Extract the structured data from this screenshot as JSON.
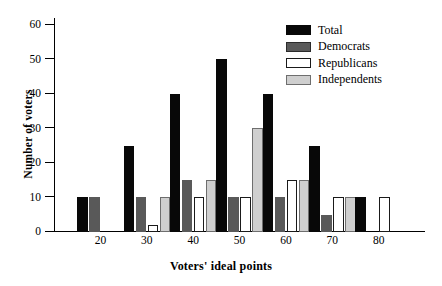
{
  "chart_data": {
    "type": "bar",
    "title": "",
    "xlabel": "Voters' ideal points",
    "ylabel": "Number of voters",
    "categories": [
      "20",
      "30",
      "40",
      "50",
      "60",
      "70",
      "80"
    ],
    "series": [
      {
        "name": "Total",
        "color": "#080808",
        "values": [
          10,
          25,
          40,
          50,
          40,
          25,
          10
        ]
      },
      {
        "name": "Democrats",
        "color": "#595959",
        "values": [
          10,
          10,
          15,
          10,
          10,
          5,
          0
        ]
      },
      {
        "name": "Republicans",
        "color": "#ffffff",
        "values": [
          0,
          2,
          10,
          10,
          15,
          10,
          10
        ]
      },
      {
        "name": "Independents",
        "color": "#cfcfcf",
        "values": [
          0,
          10,
          15,
          30,
          15,
          10,
          0
        ]
      }
    ],
    "ylim": [
      0,
      62
    ],
    "yticks": [
      0,
      10,
      20,
      30,
      40,
      50,
      60
    ],
    "xticks": [
      20,
      30,
      40,
      50,
      60,
      70,
      80
    ],
    "grid": false,
    "legend_position": "top-right"
  },
  "legend": {
    "entries": [
      {
        "label": "Total"
      },
      {
        "label": "Democrats"
      },
      {
        "label": "Republicans"
      },
      {
        "label": "Independents"
      }
    ]
  }
}
